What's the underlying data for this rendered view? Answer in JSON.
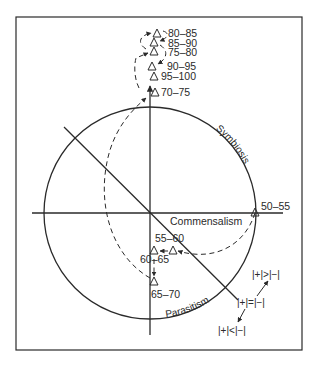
{
  "figure": {
    "frame": {
      "x": 16,
      "y": 17,
      "width": 286,
      "height": 333
    },
    "colors": {
      "ink": "#2a2a2a",
      "background": "#ffffff"
    },
    "axes": {
      "origin": [
        150,
        213
      ],
      "horizontal": {
        "x1": 32,
        "x2": 283
      },
      "vertical": {
        "y1": 84,
        "y2": 335
      }
    },
    "circle": {
      "cx": 150,
      "cy": 213,
      "r": 106
    },
    "diagonal_line": {
      "x1": 64,
      "y1": 127,
      "x2": 238,
      "y2": 300
    },
    "region_labels": {
      "symbiosis": "Symbiosis",
      "commensalism": "Commensalism",
      "parasitism": "Parasitism"
    },
    "relation_labels": {
      "greater": "|+|>|−|",
      "equal": "|+|=|−|",
      "less": "|+|<|−|"
    },
    "data_points": [
      {
        "label": "50–55",
        "x": 255,
        "y": 213
      },
      {
        "label": "55–60",
        "x": 173,
        "y": 251
      },
      {
        "label": "60–65",
        "x": 154,
        "y": 251
      },
      {
        "label": "65–70",
        "x": 154,
        "y": 282
      },
      {
        "label": "70–75",
        "x": 155,
        "y": 93
      },
      {
        "label": "75–80",
        "x": 154,
        "y": 52
      },
      {
        "label": "80–85",
        "x": 157,
        "y": 34
      },
      {
        "label": "85–90",
        "x": 154,
        "y": 43
      },
      {
        "label": "90–95",
        "x": 152,
        "y": 67
      },
      {
        "label": "95–100",
        "x": 154,
        "y": 77
      }
    ]
  }
}
